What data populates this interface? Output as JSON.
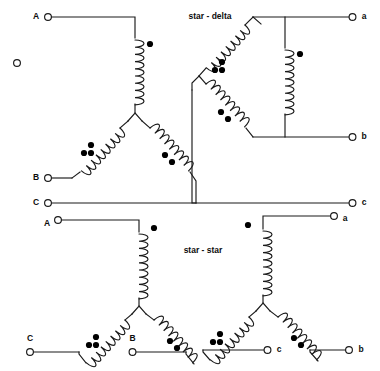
{
  "figure": {
    "name": "transformer-winding-connections",
    "background_color": "#ffffff",
    "line_color": "#1a1a1a",
    "dot_color": "#000000",
    "width": 380,
    "height": 371
  },
  "titles": {
    "top": "star - delta",
    "bottom": "star - star"
  },
  "diagrams": [
    {
      "id": "top-left",
      "type": "star",
      "side": "primary",
      "terminals": [
        {
          "label": "A",
          "position": "top-left"
        },
        {
          "label": "B",
          "position": "bottom-left"
        },
        {
          "label": "C",
          "position": "bottom"
        }
      ],
      "windings": [
        {
          "id": "top-vertical",
          "orientation": "vertical",
          "dots": 1
        },
        {
          "id": "lower-left",
          "orientation": "diagonal",
          "dots": 3
        },
        {
          "id": "lower-right",
          "orientation": "diagonal",
          "dots": 2
        }
      ]
    },
    {
      "id": "top-right",
      "type": "delta",
      "side": "secondary",
      "terminals": [
        {
          "label": "a",
          "position": "top-right"
        },
        {
          "label": "b",
          "position": "middle-right"
        },
        {
          "label": "c",
          "position": "bottom-right"
        }
      ],
      "windings": [
        {
          "id": "center-vertical",
          "orientation": "vertical",
          "dots": 1
        },
        {
          "id": "upper-left",
          "orientation": "diagonal",
          "dots": 3
        },
        {
          "id": "lower-left",
          "orientation": "diagonal",
          "dots": 2
        }
      ]
    },
    {
      "id": "bottom-left",
      "type": "star",
      "side": "primary",
      "terminals": [
        {
          "label": "A",
          "position": "top-left"
        },
        {
          "label": "C",
          "position": "bottom-left"
        },
        {
          "label": "B",
          "position": "bottom-right"
        }
      ],
      "windings": [
        {
          "id": "top-vertical",
          "orientation": "vertical",
          "dots": 1
        },
        {
          "id": "lower-left",
          "orientation": "diagonal",
          "dots": 3
        },
        {
          "id": "lower-right",
          "orientation": "diagonal",
          "dots": 2
        }
      ]
    },
    {
      "id": "bottom-right",
      "type": "star",
      "side": "secondary",
      "terminals": [
        {
          "label": "a",
          "position": "top-right"
        },
        {
          "label": "c",
          "position": "bottom-left"
        },
        {
          "label": "b",
          "position": "bottom-right"
        }
      ],
      "windings": [
        {
          "id": "top-vertical",
          "orientation": "vertical",
          "dots": 1
        },
        {
          "id": "lower-left",
          "orientation": "diagonal",
          "dots": 3
        },
        {
          "id": "lower-right",
          "orientation": "diagonal",
          "dots": 2
        }
      ]
    }
  ],
  "labels": {
    "tl_A": "A",
    "tl_B": "B",
    "tl_C": "C",
    "tr_a": "a",
    "tr_b": "b",
    "tr_c": "c",
    "bl_A": "A",
    "bl_C": "C",
    "bl_B": "B",
    "br_a": "a",
    "br_c": "c",
    "br_b": "b"
  },
  "stray_marker": {
    "name": "unconnected-terminal-circle",
    "x": 17,
    "y": 63,
    "radius": 3.4
  }
}
